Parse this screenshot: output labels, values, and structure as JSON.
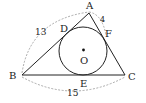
{
  "diagram": {
    "type": "geometry",
    "points": {
      "A": {
        "label": "A",
        "x": 89,
        "y": 13
      },
      "B": {
        "label": "B",
        "x": 22,
        "y": 75
      },
      "C": {
        "label": "C",
        "x": 125,
        "y": 75
      },
      "D": {
        "label": "D",
        "x": 64,
        "y": 31
      },
      "E": {
        "label": "E",
        "x": 84,
        "y": 75
      },
      "F": {
        "label": "F",
        "x": 105,
        "y": 38
      },
      "O": {
        "label": "O",
        "x": 83,
        "y": 50
      }
    },
    "circle": {
      "center": "O",
      "radius": 24
    },
    "measurements": {
      "AB": "13",
      "AF": "4",
      "BC": "15"
    },
    "colors": {
      "line": "#222222",
      "dashed": "#888888"
    }
  }
}
